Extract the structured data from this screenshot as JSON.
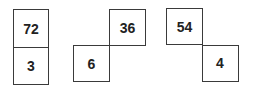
{
  "figures": [
    {
      "top": "72",
      "bottom": "3"
    },
    {
      "top": "36",
      "bottom": "6"
    },
    {
      "top": "54",
      "bottom": "4"
    }
  ]
}
